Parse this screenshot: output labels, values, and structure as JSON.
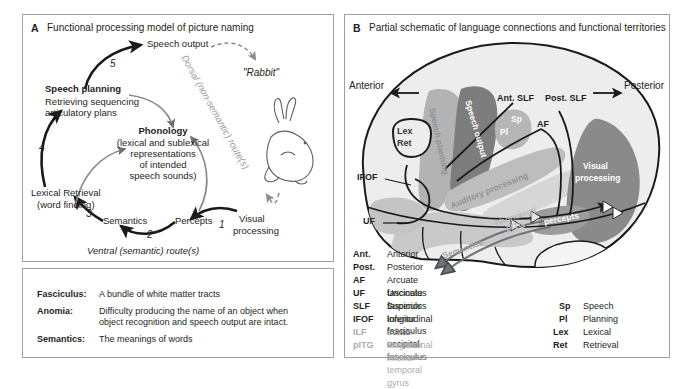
{
  "panel_a": {
    "letter": "A",
    "title": "Functional processing model of picture naming",
    "nodes": {
      "speech_output": "Speech output",
      "speech_planning_title": "Speech planning",
      "speech_planning_sub1": "Retrieving sequencing",
      "speech_planning_sub2": "articulatory plans",
      "phonology_title": "Phonology",
      "phonology_sub1": "(lexical and sublexical",
      "phonology_sub2": "representations",
      "phonology_sub3": "of intended",
      "phonology_sub4": "speech sounds)",
      "lexical_retrieval_1": "Lexical Retrieval",
      "lexical_retrieval_2": "(word finding)",
      "semantics": "Semantics",
      "percepts": "Percepts",
      "visual_processing_1": "Visual",
      "visual_processing_2": "processing",
      "rabbit_utterance": "\"Rabbit\""
    },
    "route_labels": {
      "dorsal": "Dorsal (non-semantic) route(s)",
      "ventral": "Ventral (semantic) route(s)"
    },
    "arrow_numbers": [
      "1",
      "2",
      "3",
      "4",
      "5"
    ]
  },
  "panel_a_legend": {
    "entries": [
      {
        "term": "Fasciculus:",
        "definition": "A bundle of white matter tracts"
      },
      {
        "term": "Anomia:",
        "definition": "Difficulty producing the name of an object when object recognition and speech output are intact."
      },
      {
        "term": "Semantics:",
        "definition": "The meanings of words"
      }
    ]
  },
  "panel_b": {
    "letter": "B",
    "title": "Partial schematic of language connections and functional territories",
    "orientation": {
      "anterior": "Anterior",
      "posterior": "Posterior"
    },
    "tract_labels": {
      "ant_slf": "Ant. SLF",
      "post_slf": "Post. SLF",
      "af": "AF",
      "ifof": "IFOF",
      "uf": "UF"
    },
    "region_labels": {
      "speech_planning": "Speech planning",
      "speech_output": "Speech output",
      "auditory_processing": "Auditory processing",
      "phonology": "Phonology",
      "semantics": "Semantics",
      "percepts": "percepts",
      "pitg": "pITG",
      "visual_processing_1": "Visual",
      "visual_processing_2": "processing",
      "lex": "Lex",
      "ret": "Ret",
      "sp": "Sp",
      "pl": "Pl"
    },
    "abbreviations": [
      {
        "key": "Ant.",
        "value": "Anterior",
        "faded": false
      },
      {
        "key": "Post.",
        "value": "Posterior",
        "faded": false
      },
      {
        "key": "AF",
        "value": "Arcuate fasciculus",
        "faded": false
      },
      {
        "key": "UF",
        "value": "Uncinate fasciculus",
        "faded": false
      },
      {
        "key": "SLF",
        "value": "Superior longitudinal fasciculus",
        "faded": false
      },
      {
        "key": "IFOF",
        "value": "Inferior fronto-occipital fasciculus",
        "faded": false
      },
      {
        "key": "ILF",
        "value": "Inferior longitudinal fasciculus",
        "faded": true
      },
      {
        "key": "pITG",
        "value": "Posterior inferior temporal gyrus",
        "faded": true
      }
    ],
    "abbreviations_right": [
      {
        "key": "Sp",
        "value": "Speech"
      },
      {
        "key": "Pl",
        "value": "Planning"
      },
      {
        "key": "Lex",
        "value": "Lexical"
      },
      {
        "key": "Ret",
        "value": "Retrieval"
      }
    ]
  },
  "colors": {
    "brain_fill": "#ededed",
    "speech_planning": "#b3b3b3",
    "speech_output": "#7d7d7d",
    "auditory_processing": "#bdbdbd",
    "phonology": "#d4d4d4",
    "semantics": "#c9c9c9",
    "visual_processing": "#8a8a8a",
    "percepts": "#9c9c9c",
    "outline": "#1a1a1a",
    "panel_border": "#9aa0a6",
    "faded_text": "#a8acb0"
  }
}
